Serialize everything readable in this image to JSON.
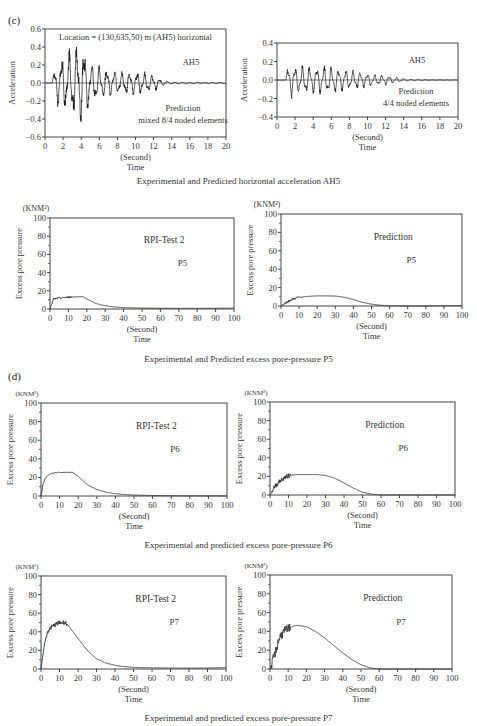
{
  "panels": [
    {
      "label": "(c)"
    },
    {
      "label": "(d)"
    }
  ],
  "captions": [
    "Experimental and Predicted horizontal acceleration AH5",
    "Experimental and Predicted excess pore-pressure P5",
    "Experimental and predicted excess pore-pressure P6",
    "Experimental and predicted excess pore-pressure P7"
  ],
  "chart_data": [
    {
      "id": "ah5-mixed",
      "type": "line",
      "title": "Location = (130,635,50) m (AH5) horizontal",
      "annotations": [
        "AH5",
        "Prediction",
        "mixed 8/4 noded elements"
      ],
      "xlabel": "(Second)",
      "xlabel2": "Time",
      "ylabel": "Acceleration",
      "yunit": "",
      "xlim": [
        0,
        20
      ],
      "ylim": [
        -0.6,
        0.6
      ],
      "xticks": [
        0,
        2,
        4,
        6,
        8,
        10,
        12,
        14,
        16,
        18,
        20
      ],
      "yticks": [
        -0.6,
        -0.4,
        -0.2,
        0.0,
        0.2,
        0.4,
        0.6
      ],
      "ytick_labels": [
        "−0.6",
        "−0.4",
        "−0.2",
        "0.0",
        "0.2",
        "0.4",
        "0.6"
      ],
      "box": {
        "left": 45,
        "top": 29,
        "right": 226,
        "bottom": 137
      },
      "signal": {
        "start": 0.8,
        "peak_time": 4.0,
        "peak_pos": 0.36,
        "peak_neg": -0.42,
        "decay_end": 13.5,
        "freq": 1.2
      },
      "envelope": {
        "x": [
          0,
          0.8,
          1.2,
          2,
          3,
          3.5,
          4,
          4.5,
          5,
          6,
          8,
          10,
          12,
          13,
          14,
          20
        ],
        "y": [
          0,
          0.05,
          0.2,
          0.3,
          0.33,
          0.38,
          0.42,
          0.35,
          0.22,
          0.17,
          0.12,
          0.12,
          0.09,
          0.03,
          0.01,
          0.005
        ]
      }
    },
    {
      "id": "ah5-44",
      "type": "line",
      "title": "",
      "annotations": [
        "AH5",
        "Prediction",
        "4/4 noded elements"
      ],
      "xlabel": "(Second)",
      "xlabel2": "Time",
      "ylabel": "Acceleration",
      "yunit": "",
      "xlim": [
        0,
        20
      ],
      "ylim": [
        -0.4,
        0.4
      ],
      "xticks": [
        0,
        2,
        4,
        6,
        8,
        10,
        12,
        14,
        16,
        18,
        20
      ],
      "yticks": [
        -0.4,
        -0.2,
        0.0,
        0.2,
        0.4
      ],
      "ytick_labels": [
        "−0.4",
        "−0.2",
        "0.0",
        "0.2",
        "0.4"
      ],
      "box": {
        "left": 277,
        "top": 43,
        "right": 458,
        "bottom": 117
      },
      "signal": {
        "start": 1.0,
        "peak_time": 1.6,
        "peak_pos": 0.18,
        "peak_neg": -0.16,
        "decay_end": 15,
        "freq": 1.25
      },
      "envelope": {
        "x": [
          0,
          1.0,
          1.5,
          2,
          4,
          6,
          7,
          8,
          9,
          10,
          11,
          12,
          13,
          14,
          15,
          16,
          20
        ],
        "y": [
          0,
          0.1,
          0.18,
          0.14,
          0.14,
          0.14,
          0.12,
          0.1,
          0.09,
          0.07,
          0.055,
          0.05,
          0.03,
          0.015,
          0.008,
          0.004,
          0.002
        ]
      }
    },
    {
      "id": "p5-exp",
      "type": "line",
      "title": "",
      "annotations": [
        "RPI-Test 2",
        "P5"
      ],
      "xlabel": "(Second)",
      "xlabel2": "Time",
      "ylabel": "Excess pore pressure",
      "yunit": "(KNM²)",
      "xlim": [
        0,
        100
      ],
      "ylim": [
        0,
        100
      ],
      "xticks": [
        0,
        10,
        20,
        30,
        40,
        50,
        60,
        70,
        80,
        90,
        100
      ],
      "yticks": [
        0,
        20,
        40,
        60,
        80,
        100
      ],
      "ytick_labels": [
        "0",
        "20",
        "40",
        "60",
        "80",
        "100"
      ],
      "box": {
        "left": 50,
        "top": 218,
        "right": 234,
        "bottom": 309
      },
      "x": [
        0,
        1,
        2,
        5,
        10,
        15,
        18,
        20,
        25,
        30,
        35,
        40,
        50,
        60,
        70,
        80,
        90,
        100
      ],
      "y": [
        0,
        6,
        11,
        12,
        13,
        13.5,
        13.5,
        11,
        6,
        3.5,
        2.2,
        1.5,
        1,
        0.8,
        0.7,
        0.7,
        0.8,
        1
      ],
      "noise": {
        "from": 1,
        "to": 12,
        "amp": 1.0
      }
    },
    {
      "id": "p5-pred",
      "type": "line",
      "title": "",
      "annotations": [
        "Prediction",
        "P5"
      ],
      "xlabel": "(Second)",
      "xlabel2": "Time",
      "ylabel": "Excess pore pressure",
      "yunit": "(KNM²)",
      "xlim": [
        0,
        100
      ],
      "ylim": [
        0,
        100
      ],
      "xticks": [
        0,
        10,
        20,
        30,
        40,
        50,
        60,
        70,
        80,
        90,
        100
      ],
      "yticks": [
        0,
        20,
        40,
        60,
        80,
        100
      ],
      "ytick_labels": [
        "0",
        "20",
        "40",
        "60",
        "80",
        "100"
      ],
      "box": {
        "left": 281,
        "top": 214,
        "right": 462,
        "bottom": 306
      },
      "x": [
        0,
        1,
        2,
        4,
        6,
        8,
        10,
        15,
        20,
        25,
        30,
        35,
        40,
        45,
        50,
        55,
        60,
        70,
        80,
        90,
        100
      ],
      "y": [
        0,
        1,
        3,
        5,
        7,
        8.5,
        9.5,
        10.5,
        11,
        11,
        10.8,
        9.5,
        7,
        4,
        2,
        0.8,
        0.2,
        0,
        0,
        0.3,
        0.5
      ],
      "noise": {
        "from": 1,
        "to": 11,
        "amp": 1.2
      }
    },
    {
      "id": "p6-exp",
      "type": "line",
      "title": "",
      "annotations": [
        "RPI-Test 2",
        "P6"
      ],
      "xlabel": "(Second)",
      "xlabel2": "Time",
      "ylabel": "Excess pore pressure",
      "yunit": "(KNM²)",
      "xlim": [
        0,
        100
      ],
      "ylim": [
        0,
        100
      ],
      "xticks": [
        0,
        10,
        20,
        30,
        40,
        50,
        60,
        70,
        80,
        90,
        100
      ],
      "yticks": [
        0,
        20,
        40,
        60,
        80,
        100
      ],
      "ytick_labels": [
        "0",
        "20",
        "40",
        "60",
        "80",
        "100"
      ],
      "box": {
        "left": 41,
        "top": 403,
        "right": 227,
        "bottom": 496
      },
      "x": [
        0,
        0.5,
        1,
        2,
        3,
        5,
        8,
        10,
        15,
        17,
        20,
        25,
        30,
        35,
        40,
        45,
        50,
        60,
        70,
        80,
        90,
        100
      ],
      "y": [
        0,
        5,
        12,
        18,
        21,
        24,
        25,
        25.5,
        25.5,
        25.5,
        21,
        12,
        7,
        4,
        2.5,
        1.5,
        1,
        0.5,
        0.3,
        0.2,
        0.2,
        0.2
      ],
      "noise": {
        "from": 5,
        "to": 17,
        "amp": 0.4
      }
    },
    {
      "id": "p6-pred",
      "type": "line",
      "title": "",
      "annotations": [
        "Prediction",
        "P6"
      ],
      "xlabel": "(Second)",
      "xlabel2": "Time",
      "ylabel": "Excess pore pressure",
      "yunit": "(KNM²)",
      "xlim": [
        0,
        100
      ],
      "ylim": [
        0,
        100
      ],
      "xticks": [
        0,
        10,
        20,
        30,
        40,
        50,
        60,
        70,
        80,
        90,
        100
      ],
      "yticks": [
        0,
        20,
        40,
        60,
        80,
        100
      ],
      "ytick_labels": [
        "0",
        "20",
        "40",
        "60",
        "80",
        "100"
      ],
      "box": {
        "left": 270,
        "top": 402,
        "right": 455,
        "bottom": 495
      },
      "x": [
        0,
        1,
        2,
        4,
        6,
        8,
        10,
        12,
        15,
        20,
        25,
        30,
        35,
        40,
        45,
        50,
        55,
        60,
        70,
        80,
        90,
        100
      ],
      "y": [
        0,
        3,
        8,
        12,
        16,
        19,
        20.5,
        21.5,
        22,
        22,
        22,
        21,
        18,
        13,
        7.5,
        3,
        0.8,
        0,
        0,
        0,
        0,
        0
      ],
      "noise": {
        "from": 1,
        "to": 11,
        "amp": 2.5
      }
    },
    {
      "id": "p7-exp",
      "type": "line",
      "title": "",
      "annotations": [
        "RPI-Test 2",
        "P7"
      ],
      "xlabel": "(Second)",
      "xlabel2": "Time",
      "ylabel": "Excess pore pressure",
      "yunit": "(KNM²)",
      "xlim": [
        0,
        100
      ],
      "ylim": [
        0,
        100
      ],
      "xticks": [
        0,
        10,
        20,
        30,
        40,
        50,
        60,
        70,
        80,
        90,
        100
      ],
      "yticks": [
        0,
        20,
        40,
        60,
        80,
        100
      ],
      "ytick_labels": [
        "0",
        "20",
        "40",
        "60",
        "80",
        "100"
      ],
      "box": {
        "left": 41,
        "top": 576,
        "right": 226,
        "bottom": 669
      },
      "x": [
        0,
        1,
        2,
        3,
        4,
        5,
        7,
        9,
        11,
        13,
        15,
        20,
        25,
        30,
        35,
        40,
        45,
        50,
        60,
        70,
        80,
        90,
        100
      ],
      "y": [
        0,
        15,
        28,
        36,
        42,
        44,
        47,
        49,
        50,
        50,
        46,
        33,
        20,
        11,
        6.5,
        4,
        2.5,
        1.8,
        1.2,
        1,
        1,
        1,
        1.5
      ],
      "noise": {
        "from": 3,
        "to": 14,
        "amp": 2.5
      }
    },
    {
      "id": "p7-pred",
      "type": "line",
      "title": "",
      "annotations": [
        "Prediction",
        "P7"
      ],
      "xlabel": "(Second)",
      "xlabel2": "Time",
      "ylabel": "Excess pore pressure",
      "yunit": "(KNM²)",
      "xlim": [
        0,
        100
      ],
      "ylim": [
        0,
        100
      ],
      "xticks": [
        0,
        10,
        20,
        30,
        40,
        50,
        60,
        70,
        80,
        90,
        100
      ],
      "yticks": [
        0,
        20,
        40,
        60,
        80,
        100
      ],
      "ytick_labels": [
        "0",
        "20",
        "40",
        "60",
        "80",
        "100"
      ],
      "box": {
        "left": 270,
        "top": 575,
        "right": 452,
        "bottom": 669
      },
      "x": [
        0,
        1,
        2,
        3,
        4,
        5,
        6,
        8,
        10,
        12,
        15,
        20,
        25,
        30,
        35,
        40,
        45,
        50,
        55,
        60,
        70,
        80,
        90,
        100
      ],
      "y": [
        0,
        5,
        12,
        18,
        25,
        32,
        36,
        40,
        43,
        45,
        46.5,
        45,
        40,
        33,
        25,
        17,
        10,
        4.5,
        1.2,
        0,
        0,
        0,
        0,
        0
      ],
      "noise": {
        "from": 1,
        "to": 11,
        "amp": 5
      }
    }
  ]
}
